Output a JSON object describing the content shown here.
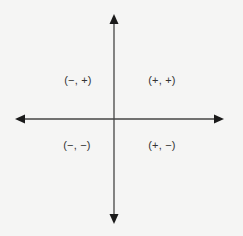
{
  "diagram": {
    "type": "coordinate-plane-quadrants",
    "colors": {
      "background": "#f5f5f4",
      "axis": "#444444",
      "arrowhead": "#1a1a1a",
      "text": "#333333"
    },
    "axes": {
      "origin": [
        114,
        119
      ],
      "x_axis": {
        "from": [
          15,
          119
        ],
        "to": [
          224,
          119
        ],
        "arrows": "both"
      },
      "y_axis": {
        "from": [
          114,
          14
        ],
        "to": [
          114,
          224
        ],
        "arrows": "both"
      }
    },
    "quadrants": [
      {
        "id": "II",
        "label": "(−, +)",
        "pos": [
          78,
          80
        ]
      },
      {
        "id": "I",
        "label": "(+, +)",
        "pos": [
          162,
          80
        ]
      },
      {
        "id": "III",
        "label": "(−, −)",
        "pos": [
          77,
          145
        ]
      },
      {
        "id": "IV",
        "label": "(+, −)",
        "pos": [
          162,
          145
        ]
      }
    ]
  }
}
